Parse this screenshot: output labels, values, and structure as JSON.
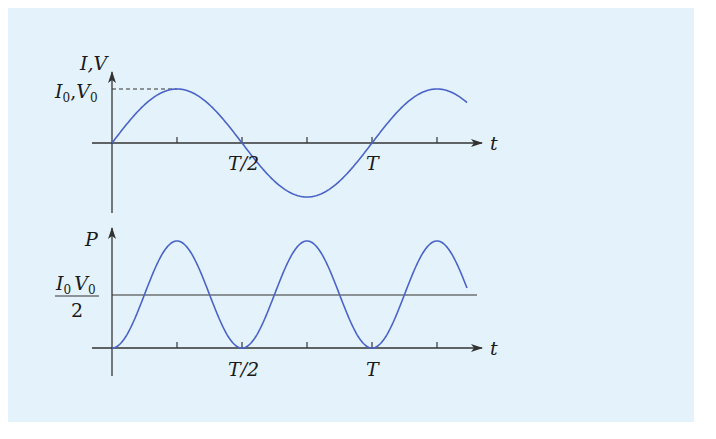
{
  "colors": {
    "background": "#e4f3fb",
    "curve": "#4a63c8",
    "axis": "#333333"
  },
  "top_graph": {
    "y_label": "I,V",
    "peak_label_I": "I",
    "peak_label_V": "V",
    "peak_sub": "0",
    "x_label": "t",
    "tick_half": "T/2",
    "tick_full": "T"
  },
  "bottom_graph": {
    "y_label": "P",
    "mean_num_I": "I",
    "mean_num_V": "V",
    "mean_sub": "0",
    "mean_den": "2",
    "x_label": "t",
    "tick_half": "T/2",
    "tick_full": "T"
  },
  "chart_data": [
    {
      "type": "line",
      "title": "Current and voltage vs time",
      "xlabel": "t",
      "ylabel": "I,V",
      "x_ticks": [
        "T/4",
        "T/2",
        "3T/4",
        "T",
        "5T/4"
      ],
      "x_tick_labels": [
        "",
        "T/2",
        "",
        "T",
        ""
      ],
      "series": [
        {
          "name": "I, V = I0,V0 sin(2πt/T)",
          "x": [
            0,
            0.25,
            0.5,
            0.75,
            1.0,
            1.25,
            1.38
          ],
          "values": [
            0,
            1,
            0,
            -1,
            0,
            1,
            0.7
          ]
        }
      ],
      "annotations": [
        "I0,V0 (peak, dashed line)"
      ]
    },
    {
      "type": "line",
      "title": "Power vs time",
      "xlabel": "t",
      "ylabel": "P",
      "x_tick_labels": [
        "",
        "T/2",
        "",
        "T",
        ""
      ],
      "series": [
        {
          "name": "P = I0V0 sin²(2πt/T)",
          "x": [
            0,
            0.25,
            0.5,
            0.75,
            1.0,
            1.25,
            1.38
          ],
          "values": [
            0,
            1,
            0,
            1,
            0,
            1,
            0.5
          ]
        },
        {
          "name": "mean I0V0/2",
          "x": [
            0,
            1.4
          ],
          "values": [
            0.5,
            0.5
          ]
        }
      ]
    }
  ]
}
